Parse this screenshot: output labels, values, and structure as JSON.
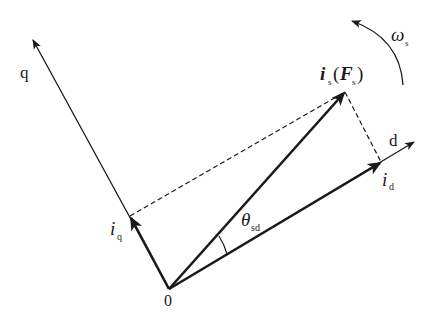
{
  "diagram": {
    "title": "",
    "colors": {
      "line": "#1a1a1a",
      "background": "#ffffff"
    },
    "origin": {
      "label": "0",
      "x": 169,
      "y": 289
    },
    "axes": {
      "q": {
        "label": "q",
        "tip": [
          32,
          38
        ]
      },
      "d": {
        "label": "d",
        "tip": [
          415,
          141
        ]
      }
    },
    "vectors": {
      "is": {
        "main": "i",
        "sub": "s",
        "paren_main": "F",
        "paren_sub": "s",
        "tip": [
          345,
          92
        ]
      },
      "id": {
        "main": "i",
        "sub": "d",
        "tip": [
          381,
          162
        ]
      },
      "iq": {
        "main": "i",
        "sub": "q",
        "tip": [
          130,
          216
        ]
      }
    },
    "angle": {
      "main": "θ",
      "sub": "sd"
    },
    "rotation": {
      "main": "ω",
      "sub": "s"
    }
  }
}
